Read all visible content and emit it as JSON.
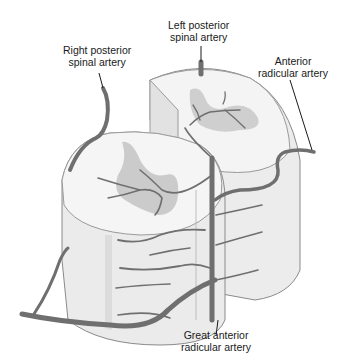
{
  "diagram": {
    "labels": {
      "left_posterior": {
        "line1": "Left posterior",
        "line2": "spinal artery"
      },
      "right_posterior": {
        "line1": "Right posterior",
        "line2": "spinal artery"
      },
      "anterior_radicular": {
        "line1": "Anterior",
        "line2": "radicular artery"
      },
      "great_anterior_radicular": {
        "line1": "Great anterior",
        "line2": "radicular artery"
      }
    },
    "colors": {
      "artery": "#6f6f6f",
      "white_matter": "#f1f1f1",
      "gray_matter": "#c9c9c9",
      "cut_face": "#e6e6e6",
      "outline": "#8a8a8a",
      "leader_line": "#1a1a1a"
    }
  }
}
